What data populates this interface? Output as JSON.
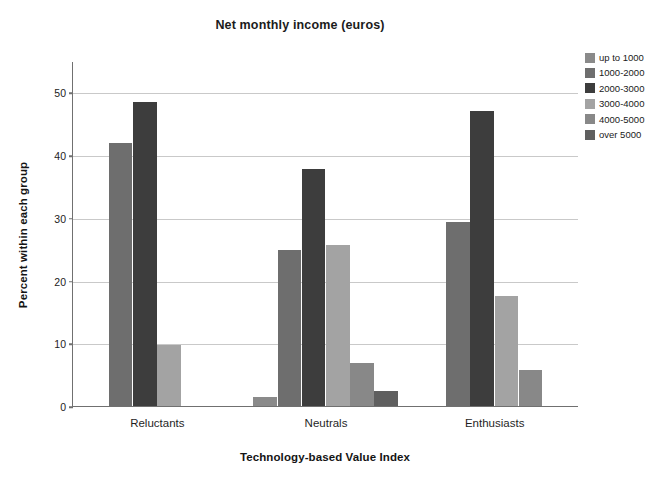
{
  "chart_data": {
    "type": "bar",
    "title": "Net monthly income (euros)",
    "xlabel": "Technology-based Value Index",
    "ylabel": "Percent within each group",
    "categories": [
      "Reluctants",
      "Neutrals",
      "Enthusiasts"
    ],
    "ylim": [
      0,
      55
    ],
    "yticks": [
      0,
      10,
      20,
      30,
      40,
      50
    ],
    "ytick_labels": [
      "0",
      "10",
      "20",
      "30",
      "40",
      "50"
    ],
    "grid": true,
    "legend_position": "right",
    "series": [
      {
        "name": "up to 1000",
        "color": "#8a8a8a",
        "values": [
          null,
          1.5,
          null
        ]
      },
      {
        "name": "1000-2000",
        "color": "#6e6e6e",
        "values": [
          42.0,
          24.8,
          29.4
        ]
      },
      {
        "name": "2000-3000",
        "color": "#3d3d3d",
        "values": [
          48.5,
          37.8,
          47.0
        ]
      },
      {
        "name": "3000-4000",
        "color": "#a3a3a3",
        "values": [
          9.7,
          25.6,
          17.5
        ]
      },
      {
        "name": "4000-5000",
        "color": "#888888",
        "values": [
          null,
          6.8,
          5.7
        ]
      },
      {
        "name": "over 5000",
        "color": "#5f5f5f",
        "values": [
          null,
          2.4,
          null
        ]
      }
    ]
  }
}
